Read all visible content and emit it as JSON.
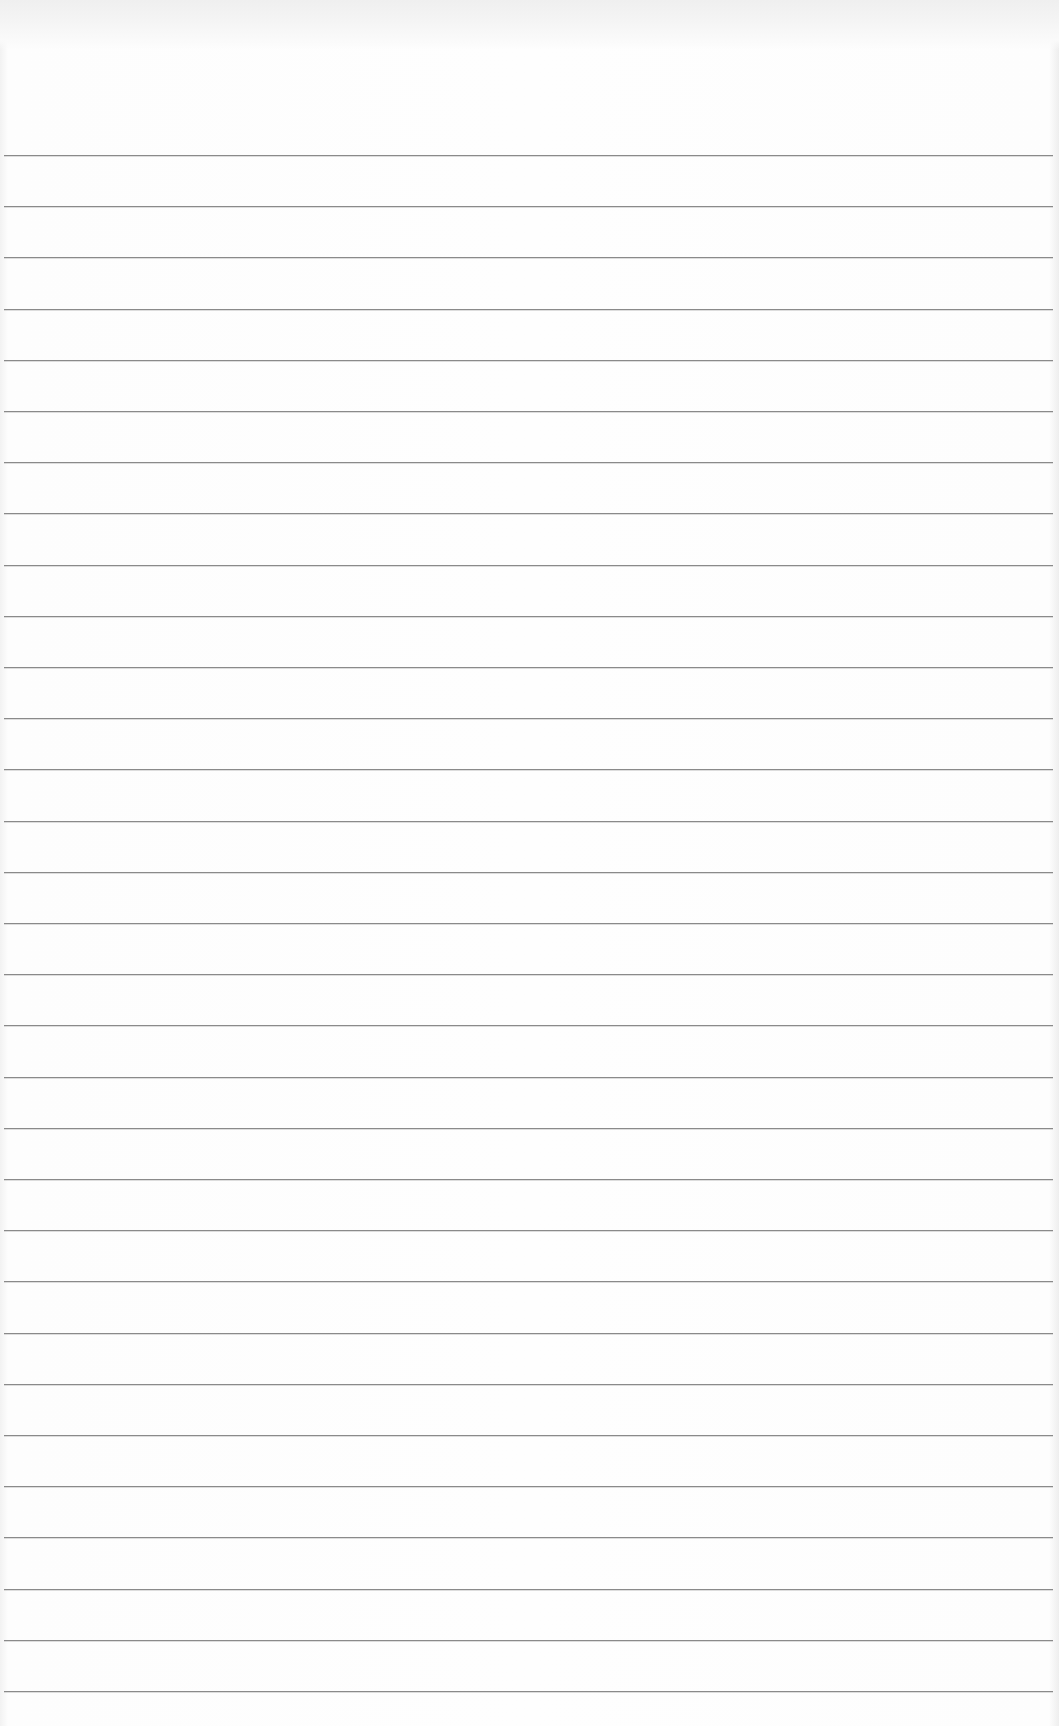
{
  "paper": {
    "type": "lined notepad page",
    "line_count": 31,
    "first_line_y": 155,
    "line_spacing_px": 51.2,
    "line_color": "#8a8a8a",
    "background_color": "#fdfdfd",
    "binding_color": "#efefef"
  }
}
